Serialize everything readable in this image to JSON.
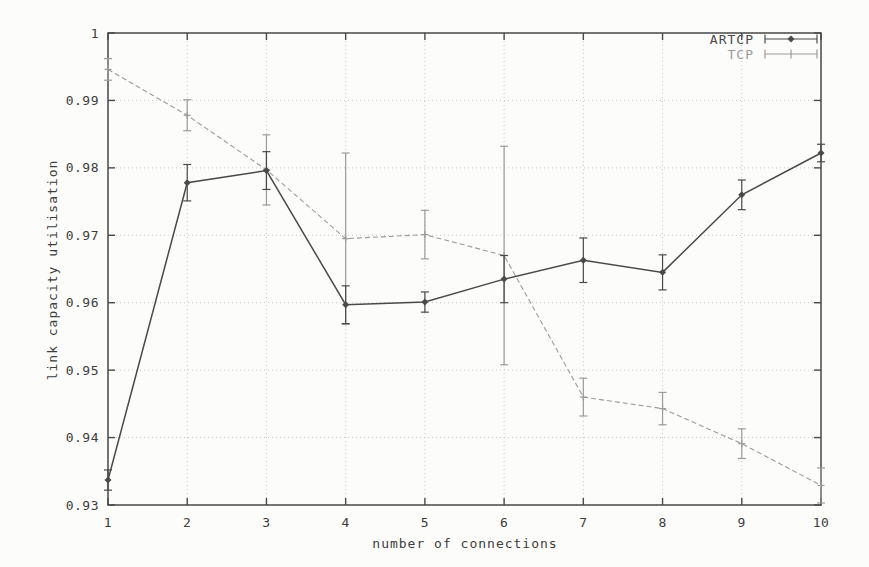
{
  "figure": {
    "background": "#fcfcfa",
    "border_color": "#4a4a4a",
    "grid_color": "#c7c7c7",
    "text_color": "#3d3d3d"
  },
  "chart_data": {
    "type": "line",
    "title": "",
    "xlabel": "number of connections",
    "ylabel": "link capacity utilisation",
    "xlim": [
      1,
      10
    ],
    "ylim": [
      0.93,
      1.0
    ],
    "grid": "dotted, both axes",
    "legend_position": "top-right-inside",
    "xtick_labels": [
      "1",
      "2",
      "3",
      "4",
      "5",
      "6",
      "7",
      "8",
      "9",
      "10"
    ],
    "xtick_values": [
      1,
      2,
      3,
      4,
      5,
      6,
      7,
      8,
      9,
      10
    ],
    "ytick_labels": [
      "1",
      "0.99",
      "0.98",
      "0.97",
      "0.96",
      "0.95",
      "0.94",
      "0.93"
    ],
    "ytick_values": [
      1.0,
      0.99,
      0.98,
      0.97,
      0.96,
      0.95,
      0.94,
      0.93
    ],
    "x": [
      1,
      2,
      3,
      4,
      5,
      6,
      7,
      8,
      9,
      10
    ],
    "series": [
      {
        "name": "ARTCP",
        "color": "#4a4a4a",
        "marker": "diamond",
        "line_style": "solid",
        "error_bars": "vertical",
        "values": [
          0.9337,
          0.9778,
          0.9796,
          0.9597,
          0.9601,
          0.9635,
          0.9663,
          0.9645,
          0.976,
          0.9822
        ],
        "yerr": [
          0.0015,
          0.0027,
          0.0028,
          0.0028,
          0.0015,
          0.0035,
          0.0033,
          0.0026,
          0.0022,
          0.0013
        ]
      },
      {
        "name": "TCP",
        "color": "#9b9b9b",
        "marker": "plus",
        "line_style": "dashed",
        "error_bars": "vertical",
        "values": [
          0.9946,
          0.9878,
          0.9797,
          0.9695,
          0.9701,
          0.967,
          0.946,
          0.9443,
          0.9391,
          0.9329
        ],
        "yerr": [
          0.0016,
          0.0023,
          0.0052,
          0.0127,
          0.0036,
          0.0162,
          0.0028,
          0.0024,
          0.0022,
          0.0026
        ]
      }
    ]
  }
}
